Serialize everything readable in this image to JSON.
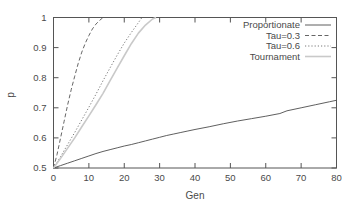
{
  "chart_data": {
    "type": "line",
    "title": "",
    "xlabel": "Gen",
    "ylabel": "p",
    "xlim": [
      0,
      80
    ],
    "ylim": [
      0.5,
      1
    ],
    "grid": false,
    "legend_position": "top-right",
    "xticks": [
      0,
      10,
      20,
      30,
      40,
      50,
      60,
      70,
      80
    ],
    "xtick_labels": [
      "0",
      "10",
      "20",
      "30",
      "40",
      "50",
      "60",
      "70",
      "80"
    ],
    "yticks": [
      0.5,
      0.6,
      0.7,
      0.8,
      0.9,
      1
    ],
    "ytick_labels": [
      "0.5",
      "0.6",
      "0.7",
      "0.8",
      "0.9",
      "1"
    ],
    "series": [
      {
        "name": "Proportionate",
        "style": "solid",
        "color": "#4d4d4d",
        "width": 0.9,
        "x": [
          0,
          2,
          4,
          6,
          8,
          10,
          12,
          14,
          16,
          18,
          20,
          22,
          24,
          26,
          28,
          30,
          32,
          34,
          36,
          38,
          40,
          44,
          48,
          52,
          56,
          60,
          64,
          66,
          70,
          74,
          78,
          80
        ],
        "values": [
          0.5,
          0.508,
          0.516,
          0.524,
          0.532,
          0.54,
          0.548,
          0.555,
          0.561,
          0.567,
          0.573,
          0.578,
          0.584,
          0.59,
          0.596,
          0.602,
          0.608,
          0.613,
          0.618,
          0.623,
          0.628,
          0.637,
          0.647,
          0.656,
          0.664,
          0.672,
          0.681,
          0.69,
          0.7,
          0.71,
          0.72,
          0.725
        ]
      },
      {
        "name": "Tau=0.3",
        "style": "dashed",
        "color": "#555555",
        "width": 0.9,
        "x": [
          0,
          1,
          2,
          3,
          4,
          5,
          6,
          7,
          8,
          9,
          10,
          11,
          12,
          13,
          14
        ],
        "values": [
          0.5,
          0.545,
          0.6,
          0.655,
          0.71,
          0.76,
          0.805,
          0.848,
          0.885,
          0.915,
          0.94,
          0.962,
          0.978,
          0.99,
          1.0
        ]
      },
      {
        "name": "Tau=0.6",
        "style": "dotted",
        "color": "#6a6a6a",
        "width": 0.9,
        "x": [
          0,
          2,
          4,
          6,
          8,
          10,
          12,
          14,
          16,
          18,
          20,
          22,
          24,
          25
        ],
        "values": [
          0.5,
          0.538,
          0.578,
          0.618,
          0.66,
          0.702,
          0.745,
          0.79,
          0.833,
          0.875,
          0.915,
          0.95,
          0.983,
          1.0
        ]
      },
      {
        "name": "Tournament",
        "style": "solid",
        "color": "#c9c9c9",
        "width": 1.6,
        "x": [
          0,
          2,
          4,
          6,
          8,
          10,
          12,
          14,
          16,
          18,
          20,
          22,
          24,
          26,
          28,
          29
        ],
        "values": [
          0.5,
          0.532,
          0.566,
          0.6,
          0.637,
          0.673,
          0.71,
          0.748,
          0.79,
          0.832,
          0.873,
          0.913,
          0.948,
          0.975,
          0.995,
          1.0
        ]
      }
    ]
  },
  "legend": {
    "entries": [
      {
        "label": "Proportionate"
      },
      {
        "label": "Tau=0.3"
      },
      {
        "label": "Tau=0.6"
      },
      {
        "label": "Tournament"
      }
    ]
  }
}
